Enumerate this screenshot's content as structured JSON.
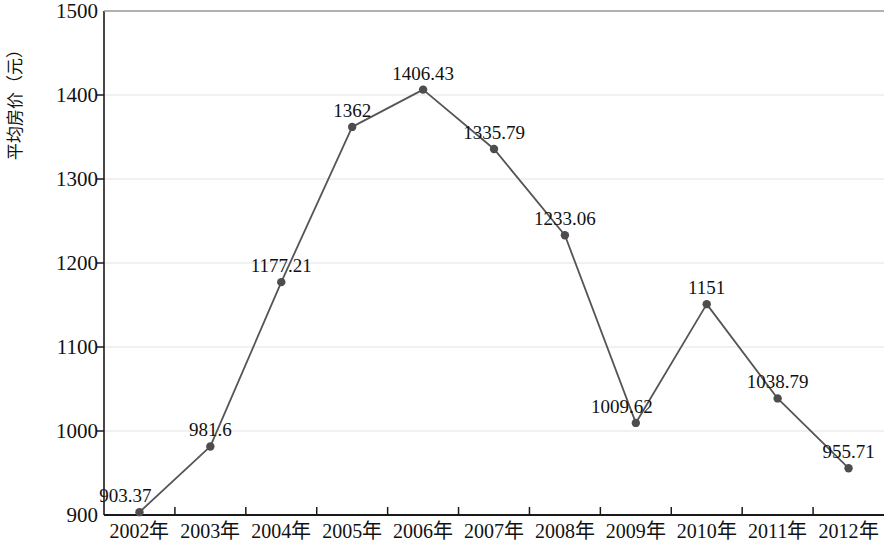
{
  "chart_data": {
    "type": "line",
    "title": "",
    "xlabel": "",
    "ylabel": "平均房价（元）",
    "categories": [
      "2002年",
      "2003年",
      "2004年",
      "2005年",
      "2006年",
      "2007年",
      "2008年",
      "2009年",
      "2010年",
      "2011年",
      "2012年"
    ],
    "values": [
      903.37,
      981.6,
      1177.21,
      1362,
      1406.43,
      1335.79,
      1233.06,
      1009.62,
      1151,
      1038.79,
      955.71
    ],
    "point_labels": [
      "903.37",
      "981.6",
      "1177.21",
      "1362",
      "1406.43",
      "1335.79",
      "1233.06",
      "1009.62",
      "1151",
      "1038.79",
      "955.71"
    ],
    "ylim": [
      900,
      1500
    ],
    "y_ticks": [
      900,
      1000,
      1100,
      1200,
      1300,
      1400,
      1500
    ],
    "y_tick_labels": [
      "900",
      "1000",
      "1100",
      "1200",
      "1300",
      "1400",
      "1500"
    ],
    "grid": true,
    "grid_axis": "y",
    "legend": false,
    "legend_position": "none",
    "series_color": "#555555",
    "marker": "circle",
    "marker_color": "#4d4d4d",
    "grid_color": "#e4e4e4",
    "axis_color": "#1a1a1a",
    "label_positions": [
      "above-left",
      "above",
      "above",
      "above",
      "above",
      "above",
      "above",
      "above-left",
      "above",
      "above",
      "above"
    ]
  }
}
